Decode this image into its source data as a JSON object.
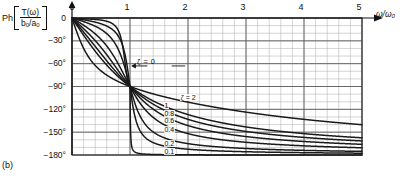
{
  "caption": "(b)",
  "axes": {
    "ylabel": {
      "prefix": "Ph",
      "numerator": "T(ω)",
      "denominator_num": "b",
      "denominator_num_sub": "0",
      "denominator_den": "a",
      "denominator_den_sub": "0",
      "full": "Ph[T(ω)/(b0/a0)]"
    },
    "xlabel": "ω/ω₀",
    "xticks": [
      "0",
      "1",
      "2",
      "3",
      "4",
      "5"
    ],
    "yticks": [
      "0",
      "−30°",
      "−60°",
      "−90°",
      "−120°",
      "−150°",
      "−180°"
    ]
  },
  "annotations": {
    "zeta_zero": "ζ = 0",
    "zeta_two": "ζ = 2"
  },
  "colors": {
    "curve": "#1a1a1a",
    "major_grid": "#5a5a5a",
    "minor_grid": "#aaaaaa",
    "frame": "#333333",
    "text": "#111111"
  },
  "chart_data": {
    "type": "line",
    "title": "",
    "subtitle": "",
    "xlabel": "ω/ω₀",
    "ylabel": "Ph[T(ω)/(b0/a0)]",
    "xlim": [
      0,
      5
    ],
    "ylim": [
      -180,
      0
    ],
    "xticks": [
      0,
      1,
      2,
      3,
      4,
      5
    ],
    "yticks": [
      0,
      -30,
      -60,
      -90,
      -120,
      -150,
      -180
    ],
    "minor_divisions_x": 5,
    "minor_divisions_y": 3,
    "grid": true,
    "legend_position": "inline-curve-labels",
    "annotations": [
      {
        "text": "ζ = 0",
        "x": 1.35,
        "y": -63,
        "arrow_to_x": 1.02,
        "arrow_to_y": -63
      },
      {
        "text": "ζ = 2",
        "x": 1.9,
        "y": -105
      }
    ],
    "series": [
      {
        "name": "ζ = 0",
        "zeta": 0,
        "label": "ζ = 0",
        "label_x": 1.35,
        "label_y": -63,
        "points_y_at": {
          "0": 0,
          "0.25": -1,
          "0.5": -2,
          "0.75": -5,
          "0.95": -25,
          "1": -90,
          "1.05": -155,
          "1.25": -177,
          "1.5": -179,
          "2": -180,
          "3": -180,
          "5": -180
        }
      },
      {
        "name": "ζ = 0.1",
        "zeta": 0.1,
        "label": "0.1",
        "label_x": 1.62,
        "label_y": -176,
        "points_y_at": {
          "0": 0,
          "0.5": -8,
          "0.8": -24,
          "1": -90,
          "1.2": -155,
          "1.5": -171,
          "2": -176,
          "3": -178,
          "4": -179,
          "5": -179
        }
      },
      {
        "name": "ζ = 0.2",
        "zeta": 0.2,
        "label": "0.2",
        "label_x": 1.62,
        "label_y": -165,
        "points_y_at": {
          "0": 0,
          "0.5": -15,
          "0.8": -42,
          "1": -90,
          "1.2": -138,
          "1.5": -159,
          "2": -167,
          "3": -173,
          "4": -176,
          "5": -177
        }
      },
      {
        "name": "ζ = 0.4",
        "zeta": 0.4,
        "label": "0.4",
        "label_x": 1.62,
        "label_y": -147,
        "points_y_at": {
          "0": 0,
          "0.5": -28,
          "0.8": -61,
          "1": -90,
          "1.2": -119,
          "1.5": -147,
          "2": -152,
          "3": -162,
          "4": -168,
          "5": -171
        }
      },
      {
        "name": "ζ = 0.6",
        "zeta": 0.6,
        "label": "0.6",
        "label_x": 1.62,
        "label_y": -135,
        "points_y_at": {
          "0": 0,
          "0.5": -39,
          "0.8": -70,
          "1": -90,
          "1.2": -110,
          "1.5": -130,
          "2": -141,
          "3": -153,
          "4": -160,
          "5": -165
        }
      },
      {
        "name": "ζ = 0.8",
        "zeta": 0.8,
        "label": "0.8",
        "label_x": 1.62,
        "label_y": -126,
        "points_y_at": {
          "0": 0,
          "0.5": -47,
          "0.8": -75,
          "1": -90,
          "1.2": -105,
          "1.5": -122,
          "2": -133,
          "3": -147,
          "4": -155,
          "5": -160
        }
      },
      {
        "name": "ζ = 1",
        "zeta": 1,
        "label": "1",
        "label_x": 1.62,
        "label_y": -116,
        "points_y_at": {
          "0": 0,
          "0.5": -53,
          "0.8": -77,
          "1": -90,
          "1.2": -103,
          "1.5": -118,
          "2": -127,
          "3": -143,
          "4": -151,
          "5": -157
        }
      },
      {
        "name": "ζ = 2",
        "zeta": 2,
        "label": "ζ = 2",
        "label_x": 1.9,
        "label_y": -105,
        "points_y_at": {
          "0": 0,
          "0.5": -69,
          "0.8": -83,
          "1": -90,
          "1.2": -96,
          "1.5": -104,
          "2": -113,
          "3": -127,
          "4": -137,
          "5": -144
        }
      }
    ]
  }
}
